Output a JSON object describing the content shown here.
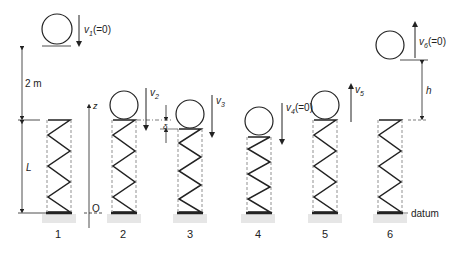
{
  "diagram": {
    "title": "",
    "colors": {
      "ink": "#222222",
      "ground": "#e3e3e3"
    },
    "dimensions": {
      "drop_height": "2 m",
      "spring_length": "L",
      "rebound_height": "h",
      "compression": "δ"
    },
    "axis": {
      "label": "z",
      "origin": "O"
    },
    "datum_label": "datum",
    "stages": [
      {
        "id": "1",
        "velocity_label": "v1",
        "velocity_sub": "1",
        "velocity_note": "(=0)",
        "direction": "down"
      },
      {
        "id": "2",
        "velocity_label": "v2",
        "velocity_sub": "2",
        "velocity_note": "",
        "direction": "down"
      },
      {
        "id": "3",
        "velocity_label": "v3",
        "velocity_sub": "3",
        "velocity_note": "",
        "direction": "down"
      },
      {
        "id": "4",
        "velocity_label": "v4",
        "velocity_sub": "4",
        "velocity_note": "(=0)",
        "direction": "down"
      },
      {
        "id": "5",
        "velocity_label": "v5",
        "velocity_sub": "5",
        "velocity_note": "",
        "direction": "up"
      },
      {
        "id": "6",
        "velocity_label": "v6",
        "velocity_sub": "6",
        "velocity_note": "(=0)",
        "direction": "up"
      }
    ]
  }
}
